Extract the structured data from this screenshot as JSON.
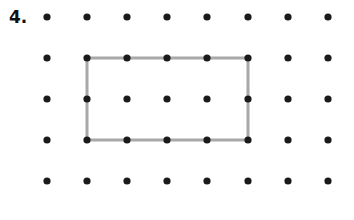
{
  "figure": {
    "label": "4.",
    "background_color": "#ffffff"
  },
  "geoboard": {
    "columns": 8,
    "rows": 5,
    "column_x": [
      47,
      87,
      127,
      167,
      207,
      248,
      288,
      328
    ],
    "row_y": [
      17,
      58,
      99,
      140,
      181
    ],
    "dot_radius": 3.6,
    "dot_color": "#1a1a1a",
    "spacing_x": 40,
    "spacing_y": 41
  },
  "chart_data": {
    "type": "scatter",
    "title": "4.",
    "xlabel": "",
    "ylabel": "",
    "grid": false,
    "xlim": [
      0,
      7
    ],
    "ylim": [
      0,
      4
    ],
    "series": [
      {
        "name": "lattice-dots",
        "marker": "filled-circle",
        "color": "#1a1a1a",
        "points": [
          [
            0,
            4
          ],
          [
            1,
            4
          ],
          [
            2,
            4
          ],
          [
            3,
            4
          ],
          [
            4,
            4
          ],
          [
            5,
            4
          ],
          [
            6,
            4
          ],
          [
            7,
            4
          ],
          [
            0,
            3
          ],
          [
            1,
            3
          ],
          [
            2,
            3
          ],
          [
            3,
            3
          ],
          [
            4,
            3
          ],
          [
            5,
            3
          ],
          [
            6,
            3
          ],
          [
            7,
            3
          ],
          [
            0,
            2
          ],
          [
            1,
            2
          ],
          [
            2,
            2
          ],
          [
            3,
            2
          ],
          [
            4,
            2
          ],
          [
            5,
            2
          ],
          [
            6,
            2
          ],
          [
            7,
            2
          ],
          [
            0,
            1
          ],
          [
            1,
            1
          ],
          [
            2,
            1
          ],
          [
            3,
            1
          ],
          [
            4,
            1
          ],
          [
            5,
            1
          ],
          [
            6,
            1
          ],
          [
            7,
            1
          ],
          [
            0,
            0
          ],
          [
            1,
            0
          ],
          [
            2,
            0
          ],
          [
            3,
            0
          ],
          [
            4,
            0
          ],
          [
            5,
            0
          ],
          [
            6,
            0
          ],
          [
            7,
            0
          ]
        ]
      }
    ],
    "annotations": [
      {
        "name": "rectangle-outline",
        "shape": "rectangle",
        "color": "#a8a8a8",
        "stroke_width": 3,
        "fill": "none",
        "vertices": [
          [
            1,
            3
          ],
          [
            5,
            3
          ],
          [
            5,
            1
          ],
          [
            1,
            1
          ]
        ],
        "pixel_vertices": [
          [
            87,
            58
          ],
          [
            248,
            58
          ],
          [
            248,
            140
          ],
          [
            87,
            140
          ]
        ],
        "width_units": 4,
        "height_units": 2
      }
    ]
  }
}
